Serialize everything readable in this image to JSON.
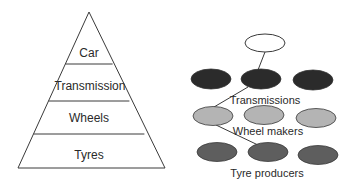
{
  "pyramid": {
    "levels": [
      {
        "label": "Car"
      },
      {
        "label": "Transmission"
      },
      {
        "label": "Wheels"
      },
      {
        "label": "Tyres"
      }
    ]
  },
  "network": {
    "top_node": {
      "fill": "#ffffff"
    },
    "tiers": [
      {
        "label": "Transmissions",
        "fill": "#2b2b2b"
      },
      {
        "label": "Wheel makers",
        "fill": "#b4b4b4"
      },
      {
        "label": "Tyre producers",
        "fill": "#5e5e5e"
      }
    ]
  },
  "colors": {
    "stroke": "#3a3a3a",
    "background": "#ffffff"
  }
}
